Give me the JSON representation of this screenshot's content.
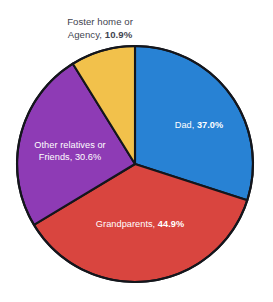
{
  "chart_data": {
    "type": "pie",
    "title": "",
    "subtitle": "",
    "xlabel": "",
    "ylabel": "",
    "legend_position": "none",
    "grid": false,
    "note": "Percentages total more than 100% because multiple responses were allowed; slices are drawn proportional to the share of the total.",
    "categories": [
      "Dad",
      "Grandparents",
      "Other relatives or Friends",
      "Foster home or Agency"
    ],
    "values": [
      37.0,
      44.9,
      30.6,
      10.9
    ],
    "value_labels": [
      "37.0%",
      "44.9%",
      "30.6%",
      "10.9%"
    ],
    "colors": [
      "#2882d4",
      "#d9453f",
      "#8e3bb5",
      "#f2c14b"
    ],
    "slices": [
      {
        "name": "Dad",
        "label_text": "Dad, ",
        "value_label": "37.0%",
        "value": 37.0,
        "color": "#2882d4",
        "label_placement": "inside",
        "label_color": "#ffffff",
        "start_angle_deg": 0.0,
        "end_angle_deg": 107.9
      },
      {
        "name": "Grandparents",
        "label_text": "Grandparents, ",
        "value_label": "44.9%",
        "value": 44.9,
        "color": "#d9453f",
        "label_placement": "inside",
        "label_color": "#ffffff",
        "start_angle_deg": 107.9,
        "end_angle_deg": 238.9
      },
      {
        "name": "Other relatives or Friends",
        "label_line_1": "Other relatives or",
        "label_text": "Friends, ",
        "value_label": "30.6%",
        "value": 30.6,
        "color": "#8e3bb5",
        "label_placement": "inside",
        "label_color": "#ffffff",
        "start_angle_deg": 238.9,
        "end_angle_deg": 328.2
      },
      {
        "name": "Foster home or Agency",
        "label_line_1": "Foster home or",
        "label_text": "Agency, ",
        "value_label": "10.9%",
        "value": 10.9,
        "color": "#f2c14b",
        "label_placement": "outside",
        "label_color": "#3f4450",
        "start_angle_deg": 328.2,
        "end_angle_deg": 360.0
      }
    ],
    "total_percent": 123.4,
    "geometry": {
      "center_x": 135,
      "center_y": 164,
      "radius": 118,
      "start_at_twelve_oclock": true,
      "direction": "clockwise"
    },
    "outline_color": "#14161c",
    "background": "#ffffff"
  },
  "clipped_top_text": "",
  "labels": {
    "dad": {
      "name": "Dad, ",
      "pct": "37.0%"
    },
    "grandparents": {
      "name": "Grandparents, ",
      "pct": "44.9%"
    },
    "other": {
      "line1": "Other relatives or",
      "name": "Friends, ",
      "pct": "30.6%"
    },
    "foster": {
      "line1": "Foster home or",
      "name": "Agency, ",
      "pct": "10.9%"
    }
  }
}
